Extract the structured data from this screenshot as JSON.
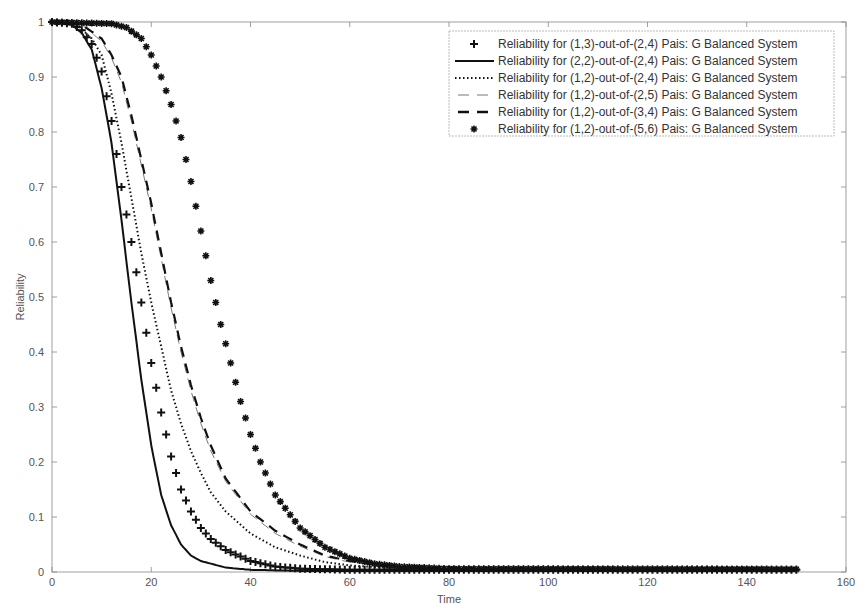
{
  "chart_data": {
    "type": "line",
    "title": "",
    "xlabel": "Time",
    "ylabel": "Reliability",
    "xlim": [
      0,
      160
    ],
    "ylim": [
      0,
      1
    ],
    "xticks": [
      0,
      20,
      40,
      60,
      80,
      100,
      120,
      140,
      160
    ],
    "yticks": [
      0,
      0.1,
      0.2,
      0.3,
      0.4,
      0.5,
      0.6,
      0.7,
      0.8,
      0.9,
      1
    ],
    "grid": false,
    "legend_position": "upper right",
    "x_range_data": [
      0,
      150
    ],
    "series": [
      {
        "name": "Reliability for (1,3)-out-of-(2,4) Pais: G Balanced System",
        "style": "plus-marker",
        "t": [
          0,
          4,
          6,
          8,
          10,
          12,
          14,
          16,
          18,
          20,
          22,
          24,
          26,
          28,
          30,
          32,
          35,
          40,
          45,
          50,
          60,
          150
        ],
        "values": [
          1,
          0.997,
          0.985,
          0.96,
          0.91,
          0.82,
          0.7,
          0.6,
          0.49,
          0.38,
          0.29,
          0.21,
          0.15,
          0.11,
          0.08,
          0.06,
          0.04,
          0.02,
          0.01,
          0.006,
          0.004,
          0.004
        ]
      },
      {
        "name": "Reliability for (2,2)-out-of-(2,4) Pais: G Balanced System",
        "style": "solid",
        "t": [
          0,
          4,
          6,
          8,
          10,
          12,
          14,
          16,
          18,
          20,
          22,
          24,
          26,
          28,
          30,
          35,
          40,
          50,
          150
        ],
        "values": [
          1,
          0.995,
          0.98,
          0.95,
          0.88,
          0.78,
          0.64,
          0.49,
          0.35,
          0.23,
          0.14,
          0.085,
          0.05,
          0.03,
          0.02,
          0.008,
          0.004,
          0.002,
          0.002
        ]
      },
      {
        "name": "Reliability for (1,2)-out-of-(2,4) Pais: G Balanced System",
        "style": "dotted",
        "t": [
          0,
          5,
          8,
          10,
          12,
          14,
          16,
          18,
          20,
          22,
          24,
          26,
          28,
          30,
          32,
          35,
          40,
          45,
          50,
          55,
          60,
          70,
          150
        ],
        "values": [
          1,
          0.995,
          0.97,
          0.94,
          0.87,
          0.78,
          0.68,
          0.58,
          0.49,
          0.41,
          0.33,
          0.27,
          0.22,
          0.18,
          0.145,
          0.11,
          0.07,
          0.045,
          0.03,
          0.018,
          0.012,
          0.006,
          0.005
        ]
      },
      {
        "name": "Reliability for (1,2)-out-of-(2,5) Pais: G Balanced System",
        "style": "thin-dashed",
        "t": [
          0,
          6,
          10,
          12,
          14,
          16,
          18,
          20,
          22,
          24,
          26,
          28,
          30,
          32,
          35,
          40,
          45,
          50,
          55,
          60,
          70,
          150
        ],
        "values": [
          1,
          0.995,
          0.965,
          0.935,
          0.89,
          0.82,
          0.74,
          0.66,
          0.57,
          0.48,
          0.4,
          0.33,
          0.27,
          0.22,
          0.165,
          0.105,
          0.07,
          0.047,
          0.028,
          0.018,
          0.008,
          0.005
        ]
      },
      {
        "name": "Reliability for (1,2)-out-of-(3,4) Pais: G Balanced System",
        "style": "thick-dashed",
        "t": [
          0,
          6,
          10,
          12,
          14,
          16,
          18,
          20,
          22,
          24,
          26,
          28,
          30,
          32,
          35,
          40,
          45,
          50,
          55,
          60,
          70,
          150
        ],
        "values": [
          1,
          0.995,
          0.97,
          0.94,
          0.9,
          0.83,
          0.75,
          0.67,
          0.58,
          0.49,
          0.41,
          0.34,
          0.28,
          0.23,
          0.17,
          0.11,
          0.075,
          0.05,
          0.03,
          0.02,
          0.008,
          0.005
        ]
      },
      {
        "name": "Reliability for (1,2)-out-of-(5,6) Pais: G Balanced System",
        "style": "star-marker",
        "t": [
          0,
          12,
          15,
          18,
          20,
          22,
          24,
          26,
          28,
          30,
          32,
          34,
          36,
          38,
          40,
          42,
          45,
          50,
          55,
          60,
          65,
          70,
          80,
          150
        ],
        "values": [
          1,
          0.997,
          0.99,
          0.97,
          0.94,
          0.9,
          0.85,
          0.79,
          0.71,
          0.62,
          0.53,
          0.45,
          0.38,
          0.31,
          0.25,
          0.2,
          0.14,
          0.08,
          0.045,
          0.025,
          0.015,
          0.01,
          0.006,
          0.005
        ]
      }
    ]
  },
  "legend": {
    "items": [
      "Reliability for (1,3)-out-of-(2,4) Pais: G Balanced System",
      "Reliability for (2,2)-out-of-(2,4) Pais: G Balanced System",
      "Reliability for (1,2)-out-of-(2,4) Pais: G Balanced System",
      "Reliability for (1,2)-out-of-(2,5) Pais: G Balanced System",
      "Reliability for (1,2)-out-of-(3,4) Pais: G Balanced System",
      "Reliability for (1,2)-out-of-(5,6) Pais: G Balanced System"
    ]
  },
  "colors": {
    "axis": "#888888",
    "series": "#111111",
    "text": "#555555"
  }
}
